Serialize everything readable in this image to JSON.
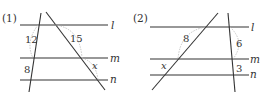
{
  "figures": [
    {
      "label": "(1)",
      "lines": {
        "l": "l",
        "m": "m",
        "n": "n"
      },
      "segments": {
        "left_upper": "12",
        "left_lower": "8",
        "right_upper": "15",
        "right_lower": "x"
      }
    },
    {
      "label": "(2)",
      "lines": {
        "l": "l",
        "m": "m",
        "n": "n"
      },
      "segments": {
        "left_upper": "8",
        "left_lower": "x",
        "right_upper": "6",
        "right_lower": "3"
      }
    }
  ],
  "colors": {
    "line": "#333333",
    "arc": "#b8b8b8",
    "background": "#ffffff"
  }
}
